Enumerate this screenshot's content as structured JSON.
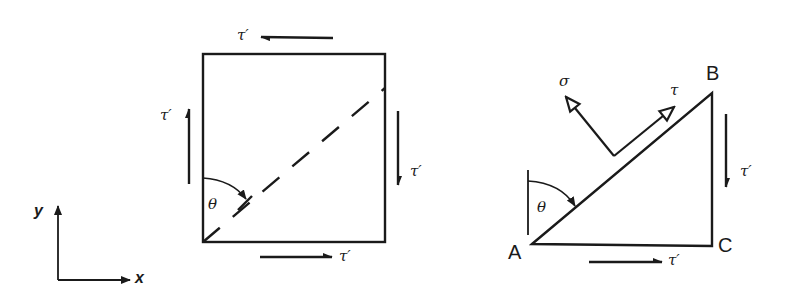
{
  "figure": {
    "colors": {
      "ink": "#1a1a1a",
      "background": "#ffffff"
    },
    "axes": {
      "x_label": "x",
      "y_label": "y"
    },
    "square_element": {
      "top_label": "τ′",
      "left_label": "τ′",
      "right_label": "τ′",
      "bottom_label": "τ′",
      "angle_label": "θ"
    },
    "triangle_element": {
      "vertex_a": "A",
      "vertex_b": "B",
      "vertex_c": "C",
      "normal_stress_label": "σ",
      "shear_stress_label": "τ",
      "right_label": "τ′",
      "bottom_label": "τ′",
      "angle_label": "θ"
    }
  }
}
